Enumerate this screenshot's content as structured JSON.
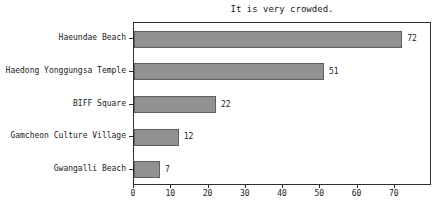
{
  "chart_data": {
    "type": "bar",
    "orientation": "horizontal",
    "title": "It is very crowded.",
    "categories": [
      "Haeundae Beach",
      "Haedong Yonggungsa Temple",
      "BIFF Square",
      "Gamcheon Culture Village",
      "Gwangalli Beach"
    ],
    "values": [
      72,
      51,
      22,
      12,
      7
    ],
    "value_labels": [
      "72",
      "51",
      "22",
      "12",
      "7"
    ],
    "xticks": [
      "0",
      "10",
      "20",
      "30",
      "40",
      "50",
      "60",
      "70"
    ],
    "xtick_values": [
      0,
      10,
      20,
      30,
      40,
      50,
      60,
      70
    ],
    "xlim": [
      0,
      80
    ],
    "xlabel": "",
    "ylabel": "",
    "grid": "off",
    "legend": "none",
    "colors": {
      "bar_fill": "#919191",
      "bar_edge": "#5f5f5f",
      "spine": "#2e2e2e",
      "text": "#1a1a1a",
      "background": "#ffffff"
    }
  }
}
